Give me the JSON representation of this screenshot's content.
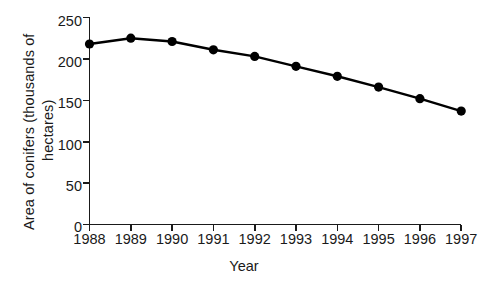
{
  "chart_data": {
    "type": "line",
    "title": "",
    "xlabel": "Year",
    "ylabel": "Area of conifers (thousands of hectares)",
    "ylabel_line1": "Area of conifers (thousands  of",
    "ylabel_line2": "hectares)",
    "categories": [
      "1988",
      "1989",
      "1990",
      "1991",
      "1992",
      "1993",
      "1994",
      "1995",
      "1996",
      "1997"
    ],
    "values": [
      218,
      225,
      221,
      211,
      203,
      191,
      179,
      166,
      152,
      137
    ],
    "series": [
      {
        "name": "Area of conifers",
        "values": [
          218,
          225,
          221,
          211,
          203,
          191,
          179,
          166,
          152,
          137
        ]
      }
    ],
    "ylim": [
      0,
      250
    ],
    "yticks": [
      0,
      50,
      100,
      150,
      200,
      250
    ],
    "ytick_labels": [
      "0",
      "50",
      "100",
      "150",
      "200",
      "250"
    ],
    "grid": false,
    "legend": null,
    "marker": "filled-circle",
    "line_color": "#000000",
    "marker_color": "#000000",
    "axis_color": "#1a1a1a",
    "background": "#ffffff"
  }
}
